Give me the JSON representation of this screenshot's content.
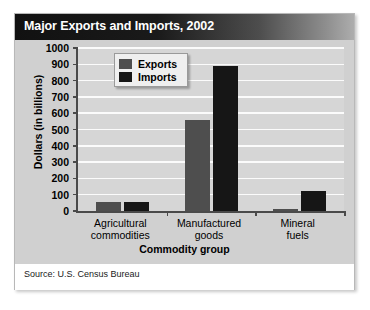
{
  "card": {
    "title": "Major Exports and Imports, 2002",
    "source": "Source: U.S. Census Bureau"
  },
  "legend": {
    "position": "top-left-inside",
    "items": [
      {
        "label": "Exports",
        "color": "#4e4e4e"
      },
      {
        "label": "Imports",
        "color": "#161616"
      }
    ]
  },
  "chart_data": {
    "type": "bar",
    "title": "Major Exports and Imports, 2002",
    "subtitle": "",
    "xlabel": "Commodity group",
    "ylabel": "Dollars (in billions)",
    "categories": [
      "Agricultural commodities",
      "Manufactured goods",
      "Mineral fuels"
    ],
    "category_lines": [
      [
        "Agricultural",
        "commodities"
      ],
      [
        "Manufactured",
        "goods"
      ],
      [
        "Mineral",
        "fuels"
      ]
    ],
    "series": [
      {
        "name": "Exports",
        "color": "#4e4e4e",
        "values": [
          55,
          558,
          12
        ]
      },
      {
        "name": "Imports",
        "color": "#161616",
        "values": [
          55,
          890,
          120
        ]
      }
    ],
    "ylim": [
      0,
      1000
    ],
    "yticks": [
      0,
      100,
      200,
      300,
      400,
      500,
      600,
      700,
      800,
      900,
      1000
    ],
    "ytick_labels": [
      "0",
      "100",
      "200",
      "300",
      "400",
      "500",
      "600",
      "700",
      "800",
      "900",
      "1000"
    ],
    "grid": true,
    "grid_axis": "y",
    "grid_color": "#fbfbfb",
    "plot_background": "#d6d6d6",
    "legend_position": "upper left",
    "annotations": [],
    "source": "Source: U.S. Census Bureau"
  }
}
